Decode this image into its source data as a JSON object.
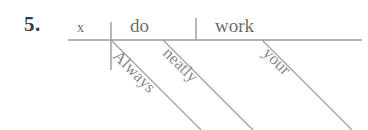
{
  "page": {
    "background_color": "#ffffff",
    "ink_color": "#8b8b8b",
    "text_color": "#6d6d6d",
    "number_color": "#3a3a3a"
  },
  "exercise": {
    "number_label": "5.",
    "sentence": "Always do your work neatly."
  },
  "diagram": {
    "type": "reed-kellogg-sentence-diagram",
    "baseline": {
      "x1": 68,
      "y1": 40,
      "x2": 362,
      "y2": 40
    },
    "dividers": [
      {
        "name": "subject-verb-divider",
        "x1": 111,
        "y1": 22,
        "x2": 111,
        "y2": 70
      },
      {
        "name": "verb-object-divider",
        "x1": 196,
        "y1": 18,
        "x2": 196,
        "y2": 40
      }
    ],
    "base_words": [
      {
        "role": "subject",
        "text": "x"
      },
      {
        "role": "verb",
        "text": "do"
      },
      {
        "role": "direct-object",
        "text": "work"
      }
    ],
    "modifiers": [
      {
        "role": "adverb-modifying-verb",
        "text": "Always",
        "attaches_to": "verb",
        "line": {
          "x1": 111,
          "y1": 40,
          "x2": 201,
          "y2": 130
        }
      },
      {
        "role": "adverb-modifying-verb",
        "text": "neatly",
        "attaches_to": "verb",
        "line": {
          "x1": 163,
          "y1": 40,
          "x2": 253,
          "y2": 130
        }
      },
      {
        "role": "possessive-adjective",
        "text": "your",
        "attaches_to": "direct-object",
        "line": {
          "x1": 262,
          "y1": 40,
          "x2": 352,
          "y2": 130
        }
      }
    ]
  }
}
